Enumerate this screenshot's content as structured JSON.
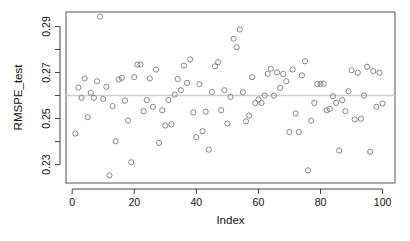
{
  "chart_data": {
    "type": "scatter",
    "title": "",
    "xlabel": "Index",
    "ylabel": "RMSPE_test",
    "xlim": [
      -2,
      104
    ],
    "ylim": [
      0.222,
      0.2963
    ],
    "xticks": [
      0,
      20,
      40,
      60,
      80,
      100
    ],
    "xtick_labels": [
      "0",
      "20",
      "40",
      "60",
      "80",
      "100"
    ],
    "yticks": [
      0.23,
      0.24,
      0.25,
      0.26,
      0.27,
      0.28,
      0.29
    ],
    "ytick_labels": [
      "0.23",
      "",
      "0.25",
      "",
      "0.27",
      "",
      "0.29"
    ],
    "reference_line": {
      "y": 0.26,
      "color": "#cfcfcf"
    },
    "grid": false,
    "legend": "none",
    "marker": "open-circle",
    "marker_color": "#7a7a7a",
    "x": [
      1,
      2,
      3,
      4,
      5,
      6,
      7,
      8,
      9,
      10,
      11,
      12,
      13,
      14,
      15,
      16,
      17,
      18,
      19,
      20,
      21,
      22,
      23,
      24,
      25,
      26,
      27,
      28,
      29,
      30,
      31,
      32,
      33,
      34,
      35,
      36,
      37,
      38,
      39,
      40,
      41,
      42,
      43,
      44,
      45,
      46,
      47,
      48,
      49,
      50,
      51,
      52,
      53,
      54,
      55,
      56,
      57,
      58,
      59,
      60,
      61,
      62,
      63,
      64,
      65,
      66,
      67,
      68,
      69,
      70,
      71,
      72,
      73,
      74,
      75,
      76,
      77,
      78,
      79,
      80,
      81,
      82,
      83,
      84,
      85,
      86,
      87,
      88,
      89,
      90,
      91,
      92,
      93,
      94,
      95,
      96,
      97,
      98,
      99,
      100
    ],
    "y": [
      0.2435,
      0.2635,
      0.259,
      0.2674,
      0.2506,
      0.2612,
      0.259,
      0.2662,
      0.2943,
      0.2585,
      0.2638,
      0.2253,
      0.2554,
      0.2401,
      0.267,
      0.2677,
      0.2578,
      0.2491,
      0.231,
      0.268,
      0.2735,
      0.2735,
      0.2532,
      0.258,
      0.2674,
      0.2551,
      0.2713,
      0.2394,
      0.2536,
      0.247,
      0.2581,
      0.2475,
      0.2604,
      0.2672,
      0.2623,
      0.273,
      0.2655,
      0.2757,
      0.2527,
      0.2419,
      0.2649,
      0.2445,
      0.253,
      0.2365,
      0.2616,
      0.2727,
      0.2745,
      0.2536,
      0.2623,
      0.2478,
      0.2594,
      0.2847,
      0.281,
      0.2887,
      0.2614,
      0.2488,
      0.2513,
      0.268,
      0.2568,
      0.2583,
      0.2568,
      0.26,
      0.2694,
      0.2717,
      0.26,
      0.2701,
      0.2633,
      0.2694,
      0.2662,
      0.2441,
      0.2713,
      0.2522,
      0.2441,
      0.2688,
      0.2749,
      0.2275,
      0.2491,
      0.2568,
      0.265,
      0.265,
      0.2652,
      0.2536,
      0.2542,
      0.2597,
      0.2568,
      0.2361,
      0.258,
      0.2532,
      0.2619,
      0.271,
      0.2496,
      0.2699,
      0.2499,
      0.26,
      0.2725,
      0.2355,
      0.2706,
      0.2551,
      0.2699,
      0.2565
    ]
  }
}
